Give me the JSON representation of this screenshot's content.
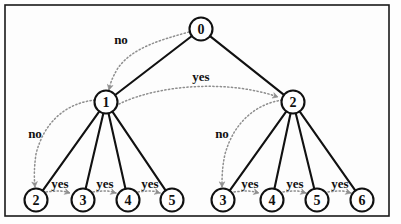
{
  "figure": {
    "type": "tree-diagram",
    "frame": {
      "x": 5,
      "y": 5,
      "width": 384,
      "height": 211
    },
    "colors": {
      "background": "#fefefe",
      "edge": "#111111",
      "node_stroke": "#111111",
      "node_fill": "#ffffff",
      "annotation": "#8e8e8e",
      "label_text": "#111111"
    }
  },
  "nodes": [
    {
      "id": "root",
      "label": "0",
      "cx": 201,
      "cy": 29,
      "r": 11.5
    },
    {
      "id": "n1",
      "label": "1",
      "cx": 106,
      "cy": 102,
      "r": 11.5
    },
    {
      "id": "n2",
      "label": "2",
      "cx": 293,
      "cy": 102,
      "r": 11.5
    },
    {
      "id": "l-leaf2",
      "label": "2",
      "cx": 36,
      "cy": 200,
      "r": 11.5
    },
    {
      "id": "l-leaf3",
      "label": "3",
      "cx": 83,
      "cy": 200,
      "r": 11.5
    },
    {
      "id": "l-leaf4",
      "label": "4",
      "cx": 128,
      "cy": 200,
      "r": 11.5
    },
    {
      "id": "l-leaf5",
      "label": "5",
      "cx": 172,
      "cy": 200,
      "r": 11.5
    },
    {
      "id": "r-leaf3",
      "label": "3",
      "cx": 223,
      "cy": 200,
      "r": 11.5
    },
    {
      "id": "r-leaf4",
      "label": "4",
      "cx": 272,
      "cy": 200,
      "r": 11.5
    },
    {
      "id": "r-leaf5",
      "label": "5",
      "cx": 317,
      "cy": 200,
      "r": 11.5
    },
    {
      "id": "r-leaf6",
      "label": "6",
      "cx": 362,
      "cy": 200,
      "r": 11.5
    }
  ],
  "edges": [
    {
      "from": "root",
      "to": "n1"
    },
    {
      "from": "root",
      "to": "n2"
    },
    {
      "from": "n1",
      "to": "l-leaf2"
    },
    {
      "from": "n1",
      "to": "l-leaf3"
    },
    {
      "from": "n1",
      "to": "l-leaf4"
    },
    {
      "from": "n1",
      "to": "l-leaf5"
    },
    {
      "from": "n2",
      "to": "r-leaf3"
    },
    {
      "from": "n2",
      "to": "r-leaf4"
    },
    {
      "from": "n2",
      "to": "r-leaf5"
    },
    {
      "from": "n2",
      "to": "r-leaf6"
    }
  ],
  "annotations": [
    {
      "id": "a-no-root-n1",
      "label": "no",
      "from": "root",
      "to": "n1",
      "path": "M 189 32 C 160 40 132 48 118 68 C 112 78 110 84 109 90",
      "label_x": 121,
      "label_y": 39
    },
    {
      "id": "a-yes-n1-n2",
      "label": "yes",
      "from": "n1",
      "to": "n2",
      "path": "M 119 104 C 160 84 230 80 278 97",
      "label_x": 201,
      "label_y": 76
    },
    {
      "id": "a-no-n1-leaf2",
      "label": "no",
      "from": "n1",
      "to": "l-leaf2",
      "path": "M 95 100 C 66 103 44 122 36 154 C 34 168 34 178 35 187",
      "label_x": 35,
      "label_y": 133
    },
    {
      "id": "a-yes-leaf2-leaf3",
      "label": "yes",
      "from": "l-leaf2",
      "to": "l-leaf3",
      "path": "M 46 192 C 56 191 62 190 70 193",
      "label_x": 60,
      "label_y": 183
    },
    {
      "id": "a-yes-leaf3-leaf4",
      "label": "yes",
      "from": "l-leaf3",
      "to": "l-leaf4",
      "path": "M 93 192 C 102 191 108 190 116 193",
      "label_x": 105,
      "label_y": 183
    },
    {
      "id": "a-yes-leaf4-leaf5",
      "label": "yes",
      "from": "l-leaf4",
      "to": "l-leaf5",
      "path": "M 138 192 C 147 191 152 190 160 193",
      "label_x": 150,
      "label_y": 183
    },
    {
      "id": "a-no-n2-leaf3",
      "label": "no",
      "from": "n2",
      "to": "r-leaf3",
      "path": "M 282 100 C 256 104 234 122 225 154 C 222 168 222 178 222 187",
      "label_x": 222,
      "label_y": 133
    },
    {
      "id": "a-yes-rleaf3-rleaf4",
      "label": "yes",
      "from": "r-leaf3",
      "to": "r-leaf4",
      "path": "M 234 192 C 243 191 250 190 259 193",
      "label_x": 250,
      "label_y": 183
    },
    {
      "id": "a-yes-rleaf4-rleaf5",
      "label": "yes",
      "from": "r-leaf4",
      "to": "r-leaf5",
      "path": "M 283 192 C 292 191 298 190 306 193",
      "label_x": 295,
      "label_y": 183
    },
    {
      "id": "a-yes-rleaf5-rleaf6",
      "label": "yes",
      "from": "r-leaf5",
      "to": "r-leaf6",
      "path": "M 328 192 C 337 191 343 190 351 193",
      "label_x": 340,
      "label_y": 183
    }
  ]
}
